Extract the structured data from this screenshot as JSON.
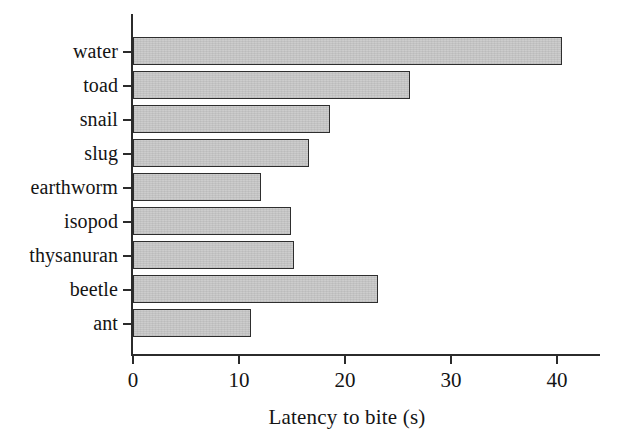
{
  "chart_data": {
    "type": "bar",
    "orientation": "horizontal",
    "title": "",
    "subtitle": "",
    "xlabel": "Latency to bite (s)",
    "ylabel": "",
    "categories": [
      "water",
      "toad",
      "snail",
      "slug",
      "earthworm",
      "isopod",
      "thysanuran",
      "beetle",
      "ant"
    ],
    "values": [
      40.5,
      26.1,
      18.6,
      16.6,
      12.1,
      14.9,
      15.2,
      23.1,
      11.1
    ],
    "series": [
      {
        "name": "Latency to bite (s)",
        "values": [
          40.5,
          26.1,
          18.6,
          16.6,
          12.1,
          14.9,
          15.2,
          23.1,
          11.1
        ]
      }
    ],
    "xlim": [
      0,
      44
    ],
    "ylim": null,
    "xticks": [
      0,
      10,
      20,
      30,
      40
    ],
    "xtick_labels": [
      "0",
      "10",
      "20",
      "30",
      "40"
    ],
    "grid": false,
    "legend": false,
    "legend_position": "none",
    "bar_fill_color": "#c9c9c9",
    "bar_edge_color": "#2e2e2e",
    "axis_color": "#2b2b2b",
    "background_color": "#ffffff"
  },
  "axis": {
    "x_title": "Latency to bite (s)",
    "tick_0": "0",
    "tick_10": "10",
    "tick_20": "20",
    "tick_30": "30",
    "tick_40": "40"
  },
  "categories": {
    "c0": "water",
    "c1": "toad",
    "c2": "snail",
    "c3": "slug",
    "c4": "earthworm",
    "c5": "isopod",
    "c6": "thysanuran",
    "c7": "beetle",
    "c8": "ant"
  }
}
